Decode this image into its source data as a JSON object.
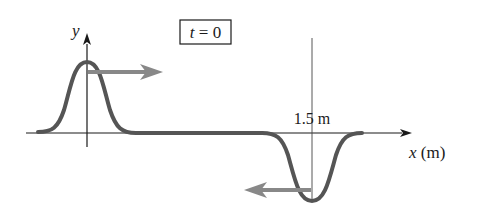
{
  "diagram": {
    "time_label": "t = 0",
    "time_label_var": "t",
    "time_label_rest": " = 0",
    "y_axis_label": "y",
    "x_axis_label_var": "x",
    "x_axis_label_unit": " (m)",
    "position_marker_label": "1.5 m",
    "pulses": [
      {
        "name": "upright-pulse",
        "center_x_m": 0,
        "direction": "right",
        "orientation": "positive"
      },
      {
        "name": "inverted-pulse",
        "center_x_m": 1.5,
        "direction": "left",
        "orientation": "negative"
      }
    ],
    "colors": {
      "pulse": "#555555",
      "arrow": "#888888",
      "axis": "#1a1a1a"
    }
  }
}
